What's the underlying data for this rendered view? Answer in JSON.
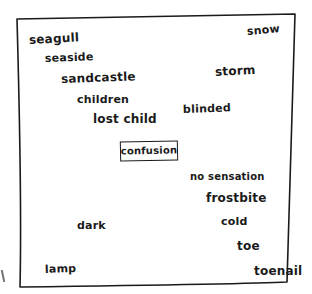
{
  "diagram": {
    "type": "hand-drawn word association map",
    "frame": {
      "shape": "irregular quadrilateral",
      "stroke_color": "#1a1a1a"
    },
    "center": {
      "label": "confusion",
      "boxed": true
    },
    "chains": {
      "beach_to_lost": [
        "seagull",
        "seaside",
        "sandcastle",
        "children",
        "lost child"
      ],
      "snow_to_blind": [
        "snow",
        "storm",
        "blinded"
      ],
      "cold_to_toe": [
        "no sensation",
        "frostbite",
        "cold",
        "toe",
        "toenail"
      ],
      "dark_to_lamp": [
        "dark",
        "lamp"
      ]
    },
    "words": {
      "seagull": "seagull",
      "seaside": "seaside",
      "sandcastle": "sandcastle",
      "children": "children",
      "lost_child": "lost child",
      "snow": "snow",
      "storm": "storm",
      "blinded": "blinded",
      "confusion": "confusion",
      "no_sensation": "no sensation",
      "frostbite": "frostbite",
      "cold": "cold",
      "dark": "dark",
      "toe": "toe",
      "lamp": "lamp",
      "toenail": "toenail"
    },
    "colors": {
      "ink": "#1a1a1a",
      "paper": "#ffffff"
    }
  }
}
